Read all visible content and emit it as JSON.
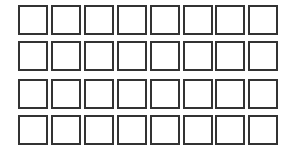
{
  "grid": {
    "rows": 4,
    "columns": 8,
    "cells": [
      [
        {
          "checked": false
        },
        {
          "checked": false
        },
        {
          "checked": false
        },
        {
          "checked": false
        },
        {
          "checked": false
        },
        {
          "checked": false
        },
        {
          "checked": false
        },
        {
          "checked": false
        }
      ],
      [
        {
          "checked": false
        },
        {
          "checked": false
        },
        {
          "checked": false
        },
        {
          "checked": false
        },
        {
          "checked": false
        },
        {
          "checked": false
        },
        {
          "checked": false
        },
        {
          "checked": false
        }
      ],
      [
        {
          "checked": false
        },
        {
          "checked": false
        },
        {
          "checked": false
        },
        {
          "checked": false
        },
        {
          "checked": false
        },
        {
          "checked": false
        },
        {
          "checked": false
        },
        {
          "checked": false
        }
      ],
      [
        {
          "checked": false
        },
        {
          "checked": false
        },
        {
          "checked": false
        },
        {
          "checked": false
        },
        {
          "checked": false
        },
        {
          "checked": false
        },
        {
          "checked": false
        },
        {
          "checked": false
        }
      ]
    ],
    "border_color": "#333333",
    "fill_color": "#ffffff"
  }
}
